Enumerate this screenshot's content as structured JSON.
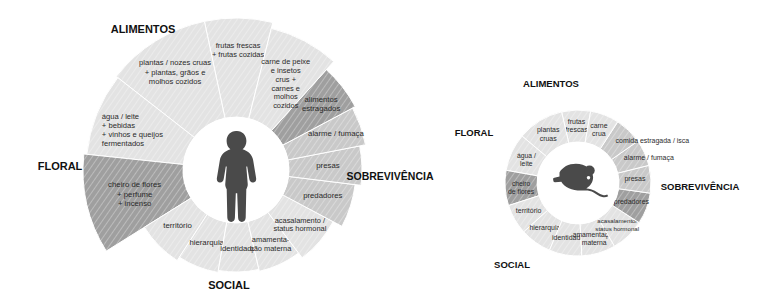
{
  "figure": {
    "type": "radial-sector-diagram-pair",
    "background": "#ffffff",
    "colors": {
      "wedge_light": "#e3e3e3",
      "wedge_light_alt": "#ececec",
      "wedge_mid": "#c9c9c9",
      "wedge_dark": "#9f9f9f",
      "wedge_darker": "#8f8f8f",
      "hub_fill": "#ffffff",
      "silhouette": "#4a4a4a",
      "separator": "#ffffff",
      "text": "#2b2b2b",
      "heading": "#111111"
    }
  },
  "diagrams": [
    {
      "id": "human",
      "center_icon": "human-silhouette-icon",
      "categories": [
        {
          "key": "alimentos",
          "label": "ALIMENTOS"
        },
        {
          "key": "sobrevivencia",
          "label": "SOBREVIVÊNCIA"
        },
        {
          "key": "social",
          "label": "SOCIAL"
        },
        {
          "key": "floral",
          "label": "FLORAL"
        }
      ],
      "sectors": [
        {
          "key": "frutas",
          "category": "alimentos",
          "lines": [
            "frutas frescas",
            "+ frutas cozidas"
          ],
          "shade": "light",
          "extent": "long"
        },
        {
          "key": "plantas",
          "category": "alimentos",
          "lines": [
            "plantas / nozes cruas",
            "+ plantas, grãos e",
            "molhos cozidos"
          ],
          "shade": "light",
          "extent": "long"
        },
        {
          "key": "agua-leite",
          "category": "alimentos",
          "lines": [
            "água / leite",
            "+ bebidas",
            "+ vinhos e queijos",
            "fermentados"
          ],
          "shade": "light",
          "extent": "long"
        },
        {
          "key": "cheiro-de-flores",
          "category": "floral",
          "lines": [
            "cheiro de flores",
            "+ perfume",
            "+ incenso"
          ],
          "shade": "dark",
          "extent": "long"
        },
        {
          "key": "territorio",
          "category": "social",
          "lines": [
            "território"
          ],
          "shade": "light",
          "extent": "short"
        },
        {
          "key": "hierarquia",
          "category": "social",
          "lines": [
            "hierarquia"
          ],
          "shade": "light",
          "extent": "short"
        },
        {
          "key": "identidade",
          "category": "social",
          "lines": [
            "identidade"
          ],
          "shade": "light",
          "extent": "short"
        },
        {
          "key": "amamentacao",
          "category": "social",
          "lines": [
            "amamenta-",
            "ção materna"
          ],
          "shade": "light",
          "extent": "short"
        },
        {
          "key": "acasalamento",
          "category": "social",
          "lines": [
            "acasalamento /",
            "status hormonal"
          ],
          "shade": "light",
          "extent": "short"
        },
        {
          "key": "predadores",
          "category": "sobrevivencia",
          "lines": [
            "predadores"
          ],
          "shade": "mid",
          "extent": "medium"
        },
        {
          "key": "presas",
          "category": "sobrevivencia",
          "lines": [
            "presas"
          ],
          "shade": "mid",
          "extent": "medium"
        },
        {
          "key": "alarme-fumaca",
          "category": "sobrevivencia",
          "lines": [
            "alarme / fumaça"
          ],
          "shade": "mid",
          "extent": "medium"
        },
        {
          "key": "alimentos-estragados",
          "category": "sobrevivencia",
          "lines": [
            "alimentos",
            "estragados"
          ],
          "shade": "dark",
          "extent": "medium"
        },
        {
          "key": "carne-peixe",
          "category": "alimentos",
          "lines": [
            "carne de peixe",
            "e insetos",
            "crus +",
            "carnes e",
            "molhos",
            "cozidos"
          ],
          "shade": "light",
          "extent": "long"
        }
      ]
    },
    {
      "id": "mouse",
      "center_icon": "mouse-silhouette-icon",
      "categories": [
        {
          "key": "alimentos",
          "label": "ALIMENTOS"
        },
        {
          "key": "sobrevivencia",
          "label": "SOBREVIVÊNCIA"
        },
        {
          "key": "social",
          "label": "SOCIAL"
        },
        {
          "key": "floral",
          "label": "FLORAL"
        }
      ],
      "sectors": [
        {
          "key": "frutas",
          "category": "alimentos",
          "lines": [
            "frutas",
            "frescas"
          ],
          "shade": "light"
        },
        {
          "key": "plantas",
          "category": "alimentos",
          "lines": [
            "plantas",
            "cruas"
          ],
          "shade": "light"
        },
        {
          "key": "agua-leite",
          "category": "alimentos",
          "lines": [
            "água /",
            "leite"
          ],
          "shade": "light"
        },
        {
          "key": "cheiro-de-flores",
          "category": "floral",
          "lines": [
            "cheiro",
            "de flores"
          ],
          "shade": "dark"
        },
        {
          "key": "territorio",
          "category": "social",
          "lines": [
            "território"
          ],
          "shade": "light"
        },
        {
          "key": "hierarquia",
          "category": "social",
          "lines": [
            "hierarquia"
          ],
          "shade": "light"
        },
        {
          "key": "identidade",
          "category": "social",
          "lines": [
            "identidade"
          ],
          "shade": "light"
        },
        {
          "key": "amamentacao",
          "category": "social",
          "lines": [
            "amamentação",
            "materna"
          ],
          "shade": "light"
        },
        {
          "key": "acasalamento",
          "category": "social",
          "lines": [
            "acasalamento/",
            "status hormonal"
          ],
          "shade": "light"
        },
        {
          "key": "predadores",
          "category": "sobrevivencia",
          "lines": [
            "predadores"
          ],
          "shade": "dark"
        },
        {
          "key": "presas",
          "category": "sobrevivencia",
          "lines": [
            "presas"
          ],
          "shade": "mid"
        },
        {
          "key": "alarme-fumaca",
          "category": "sobrevivencia",
          "lines": [
            "alarme / fumaça"
          ],
          "shade": "mid"
        },
        {
          "key": "comida-estragada",
          "category": "sobrevivencia",
          "lines": [
            "comida estragada / isca"
          ],
          "shade": "mid"
        },
        {
          "key": "carne-crua",
          "category": "alimentos",
          "lines": [
            "carne",
            "crua"
          ],
          "shade": "light"
        }
      ]
    }
  ]
}
